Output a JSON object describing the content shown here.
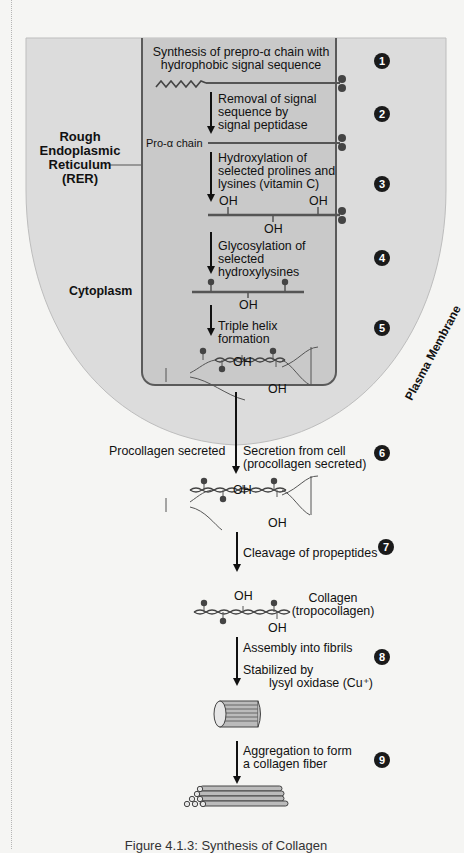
{
  "labels": {
    "step1": [
      "Synthesis of prepro-α chain with",
      "hydrophobic signal sequence"
    ],
    "step2": [
      "Removal of signal",
      "sequence by",
      "signal peptidase"
    ],
    "pro_alpha_chain": "Pro-α chain",
    "step3": [
      "Hydroxylation of",
      "selected prolines and",
      "lysines (vitamin C)"
    ],
    "step4": [
      "Glycosylation of",
      "selected",
      "hydroxylysines"
    ],
    "step5": [
      "Triple helix",
      "formation"
    ],
    "rer": [
      "Rough",
      "Endoplasmic",
      "Reticulum",
      "(RER)"
    ],
    "cytoplasm": "Cytoplasm",
    "plasma_membrane": "Plasma Membrane",
    "procollagen_secreted": "Procollagen secreted",
    "step6": [
      "Secretion from cell",
      "(procollagen secreted)"
    ],
    "step7": "Cleavage of propeptides",
    "collagen": [
      "Collagen",
      "(tropocollagen)"
    ],
    "step8a": "Assembly into fibrils",
    "step8b": [
      "Stabilized by",
      "lysyl oxidase (Cu⁺)"
    ],
    "step9": [
      "Aggregation to form",
      "a collagen fiber"
    ],
    "oh": "OH",
    "ss": "S-S",
    "caption": "Figure 4.1.3: Synthesis of Collagen"
  },
  "step_numbers": [
    "1",
    "2",
    "3",
    "4",
    "5",
    "6",
    "7",
    "8",
    "9"
  ],
  "colors": {
    "cell": "#dcdcdc",
    "rer": "#c9c9c9",
    "ink": "#1a1a1a",
    "chain": "#555555"
  }
}
